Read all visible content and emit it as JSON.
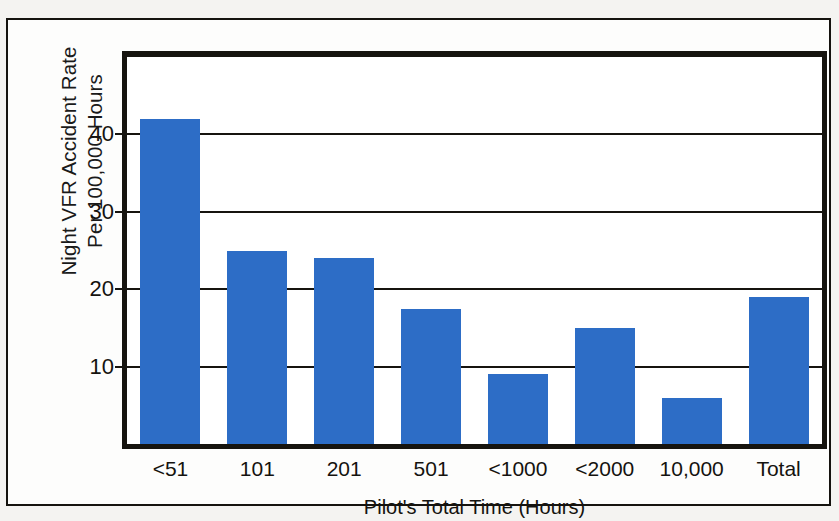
{
  "chart_data": {
    "type": "bar",
    "title": "",
    "xlabel": "Pilot's Total Time (Hours)",
    "ylabel_line1": "Night VFR Accident Rate",
    "ylabel_line2": "Per 100,000 Hours",
    "categories": [
      "<51",
      "101",
      "201",
      "501",
      "<1000",
      "<2000",
      "10,000",
      "Total"
    ],
    "values": [
      42,
      25,
      24,
      17.5,
      9,
      15,
      6,
      19
    ],
    "yticks": [
      10,
      20,
      30,
      40
    ],
    "ylim": [
      0,
      50
    ],
    "grid": true,
    "legend": "none",
    "bar_color": "#2d6dc6",
    "axis_color": "#16140f",
    "background_color": "#ffffff"
  },
  "figure": {
    "frame_color": "#15130f",
    "page_background": "#f4f3f1"
  }
}
